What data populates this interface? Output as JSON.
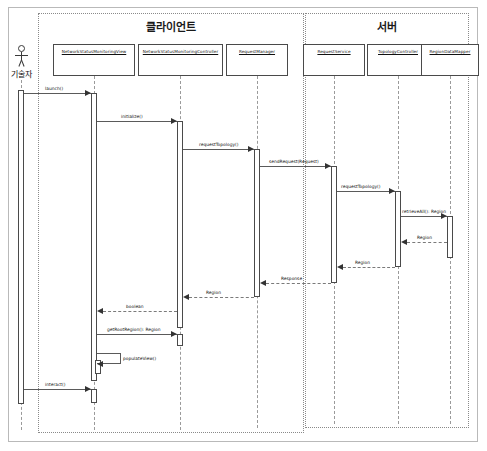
{
  "diagram": {
    "actor": {
      "name": "기술자",
      "icon": "actor-stick-figure-icon"
    },
    "partitions": [
      {
        "id": "client",
        "label": "클라이언트"
      },
      {
        "id": "server",
        "label": "서버"
      }
    ],
    "lifelines": [
      {
        "id": "view",
        "label": "NetworkStatusMonitoringView",
        "partition": "client"
      },
      {
        "id": "controller",
        "label": "NetworkStatusMonitoringController",
        "partition": "client"
      },
      {
        "id": "requestmanager",
        "label": "RequestManager",
        "partition": "client"
      },
      {
        "id": "requestservice",
        "label": "RequestService",
        "partition": "server"
      },
      {
        "id": "topologycontroller",
        "label": "TopologyController",
        "partition": "server"
      },
      {
        "id": "regiondatamapper",
        "label": "RegionDataMapper",
        "partition": "server"
      }
    ],
    "messages": [
      {
        "id": "m1",
        "label": "launch()",
        "from": "actor",
        "to": "view",
        "kind": "call"
      },
      {
        "id": "m2",
        "label": "initialize()",
        "from": "view",
        "to": "controller",
        "kind": "call"
      },
      {
        "id": "m3",
        "label": "requestTopology()",
        "from": "controller",
        "to": "requestmanager",
        "kind": "call"
      },
      {
        "id": "m4",
        "label": "sendRequest(Request)",
        "from": "requestmanager",
        "to": "requestservice",
        "kind": "call"
      },
      {
        "id": "m5",
        "label": "requestTopology()",
        "from": "requestservice",
        "to": "topologycontroller",
        "kind": "call"
      },
      {
        "id": "m6",
        "label": "retrieveAll(): Region",
        "from": "topologycontroller",
        "to": "regiondatamapper",
        "kind": "call"
      },
      {
        "id": "m7",
        "label": "Region",
        "from": "regiondatamapper",
        "to": "topologycontroller",
        "kind": "return"
      },
      {
        "id": "m8",
        "label": "Region",
        "from": "topologycontroller",
        "to": "requestservice",
        "kind": "return"
      },
      {
        "id": "m9",
        "label": "Response",
        "from": "requestservice",
        "to": "requestmanager",
        "kind": "return"
      },
      {
        "id": "m10",
        "label": "Region",
        "from": "requestmanager",
        "to": "controller",
        "kind": "return"
      },
      {
        "id": "m11",
        "label": "boolean",
        "from": "controller",
        "to": "view",
        "kind": "return"
      },
      {
        "id": "m12",
        "label": "getRootRegion(): Region",
        "from": "view",
        "to": "controller",
        "kind": "call"
      },
      {
        "id": "m13",
        "label": "populateView()",
        "from": "view",
        "to": "view",
        "kind": "self-call"
      },
      {
        "id": "m14",
        "label": "interact()",
        "from": "actor",
        "to": "view",
        "kind": "call"
      }
    ],
    "colors": {
      "frame_border": "#b9b9b9",
      "partition_border": "#8a8a8a",
      "object_border": "#4a4a4a",
      "lifeline": "#9a9a9a",
      "message_line": "#5a5a5a",
      "return_line": "#7a7a7a",
      "text": "#111111",
      "background": "#ffffff"
    }
  }
}
